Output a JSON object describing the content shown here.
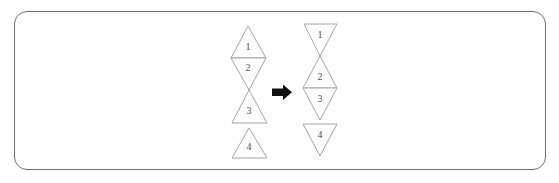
{
  "figure": {
    "frame": {
      "border_color": "#6e6e72",
      "background_color": "#ffffff",
      "corner_radius": 13
    },
    "stroke_color": "#9a9a9e",
    "label_color": "#4d4d52",
    "arrow_color": "#111114"
  },
  "arrow": {
    "name": "transform-arrow",
    "direction": "right",
    "color": "#111114",
    "x": 272,
    "y": 92
  },
  "ghost_artifacts": {
    "top": "",
    "middle": "",
    "bottom": ""
  },
  "groups": [
    {
      "id": "left-group",
      "name": "unfolded-strip",
      "center_x": 248,
      "triangles": [
        {
          "label": "1",
          "orientation": "up",
          "points": "248,26 231,58 266,58",
          "label_x": 248,
          "label_y": 48
        },
        {
          "label": "2",
          "orientation": "down",
          "points": "231,58 266,58 249,90",
          "label_x": 248,
          "label_y": 69
        },
        {
          "label": "3",
          "orientation": "up",
          "points": "249,90 232,123 267,123",
          "label_x": 249,
          "label_y": 112
        },
        {
          "label": "4",
          "orientation": "up",
          "points": "249,128 232,158 267,158",
          "label_x": 249,
          "label_y": 148
        }
      ]
    },
    {
      "id": "right-group",
      "name": "folded-strip",
      "center_x": 320,
      "triangles": [
        {
          "label": "1",
          "orientation": "down",
          "points": "304,24 337,24 320,56",
          "label_x": 320,
          "label_y": 36
        },
        {
          "label": "2",
          "orientation": "up",
          "points": "320,56 303,88 337,88",
          "label_x": 320,
          "label_y": 78
        },
        {
          "label": "3",
          "orientation": "down",
          "points": "303,88 337,88 320,120",
          "label_x": 320,
          "label_y": 100
        },
        {
          "label": "4",
          "orientation": "down",
          "points": "303,124 337,124 320,156",
          "label_x": 320,
          "label_y": 136
        }
      ]
    }
  ],
  "chart_data": {
    "type": "diagram",
    "series": [
      {
        "name": "before-fold",
        "labels": [
          "1",
          "2",
          "3",
          "4"
        ],
        "orientations": [
          "up",
          "down",
          "up",
          "up"
        ]
      },
      {
        "name": "after-fold",
        "labels": [
          "1",
          "2",
          "3",
          "4"
        ],
        "orientations": [
          "down",
          "up",
          "down",
          "down"
        ]
      }
    ]
  }
}
